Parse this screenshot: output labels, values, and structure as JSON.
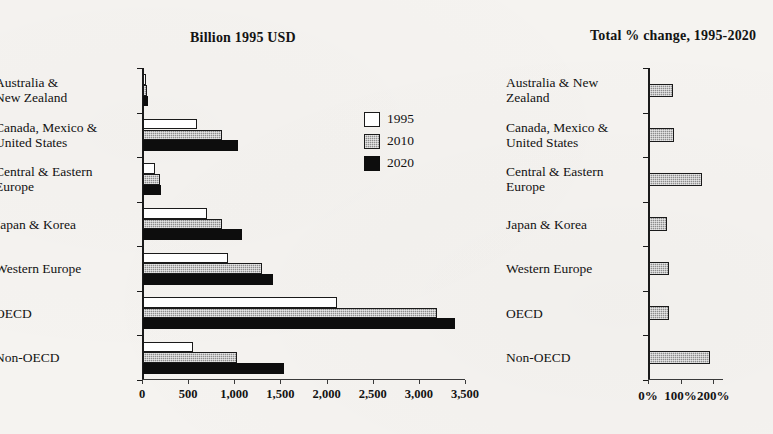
{
  "chart_data": [
    {
      "type": "bar",
      "title": "Billion 1995 USD",
      "orientation": "horizontal",
      "xlabel": "",
      "ylabel": "",
      "xlim": [
        0,
        3500
      ],
      "xticks": [
        0,
        500,
        1000,
        1500,
        2000,
        2500,
        3000,
        3500
      ],
      "xticklabels": [
        "0",
        "500",
        "1,000",
        "1,500",
        "2,000",
        "2,500",
        "3,000",
        "3,500"
      ],
      "grid": false,
      "legend_position": "inside-right",
      "categories": [
        "Australia &\nNew Zealand",
        "Canada, Mexico &\nUnited States",
        "Central & Eastern\nEurope",
        "Japan & Korea",
        "Western Europe",
        "OECD",
        "Non-OECD"
      ],
      "series": [
        {
          "name": "1995",
          "color": "#ffffff",
          "values": [
            30,
            580,
            125,
            690,
            920,
            2100,
            545
          ]
        },
        {
          "name": "2010",
          "color": "#8d8d8d",
          "values": [
            42,
            860,
            185,
            855,
            1290,
            3190,
            1020
          ]
        },
        {
          "name": "2020",
          "color": "#0d0d0d",
          "values": [
            52,
            1030,
            200,
            1070,
            1410,
            3380,
            1530
          ]
        }
      ]
    },
    {
      "type": "bar",
      "title": "Total % change, 1995-2020",
      "orientation": "horizontal",
      "xlabel": "",
      "ylabel": "",
      "xlim": [
        0,
        230
      ],
      "xticks": [
        0,
        100,
        200
      ],
      "xticklabels": [
        "0%",
        "100%",
        "200%"
      ],
      "grid": false,
      "legend_position": "none",
      "categories": [
        "Australia & New\nZealand",
        "Canada, Mexico &\nUnited States",
        "Central & Eastern\nEurope",
        "Japan & Korea",
        "Western Europe",
        "OECD",
        "Non-OECD"
      ],
      "series": [
        {
          "name": "Total % change, 1995-2020",
          "color": "#8d8d8d",
          "values": [
            74,
            77,
            162,
            55,
            60,
            60,
            186
          ]
        }
      ]
    }
  ],
  "left_chart": {
    "title": "Billion 1995 USD",
    "xticklabels": [
      "0",
      "500",
      "1,000",
      "1,500",
      "2,000",
      "2,500",
      "3,000",
      "3,500"
    ],
    "categories": [
      "Australia &\nNew Zealand",
      "Canada, Mexico &\nUnited States",
      "Central & Eastern\nEurope",
      "Japan & Korea",
      "Western Europe",
      "OECD",
      "Non-OECD"
    ],
    "legend": [
      "1995",
      "2010",
      "2020"
    ]
  },
  "right_chart": {
    "title": "Total % change, 1995-2020",
    "xticklabels": [
      "0%",
      "100%",
      "200%"
    ],
    "categories": [
      "Australia & New\nZealand",
      "Canada, Mexico &\nUnited States",
      "Central & Eastern\nEurope",
      "Japan & Korea",
      "Western Europe",
      "OECD",
      "Non-OECD"
    ]
  }
}
